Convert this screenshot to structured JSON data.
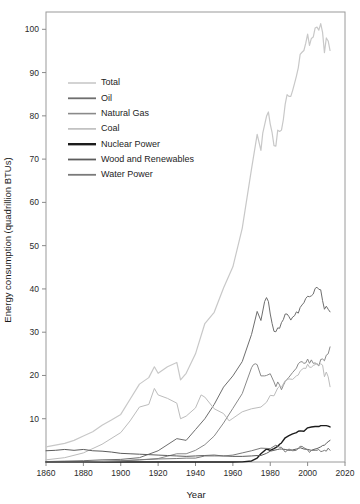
{
  "chart_data": {
    "type": "line",
    "title": "",
    "subtitle": "",
    "xlabel": "Year",
    "ylabel": "Energy consumption (quadrillion BTUs)",
    "xlim": [
      1860,
      2020
    ],
    "ylim": [
      0,
      104
    ],
    "grid": false,
    "legend_position": "upper-left-inside",
    "xticks": [
      1860,
      1880,
      1900,
      1920,
      1940,
      1960,
      1980,
      2000,
      2020
    ],
    "xtick_labels": [
      "1860",
      "1880",
      "1900",
      "1920",
      "1940",
      "1960",
      "1980",
      "2000",
      "2020"
    ],
    "yticks": [
      10,
      20,
      30,
      40,
      50,
      60,
      70,
      80,
      90,
      100
    ],
    "ytick_labels": [
      "10",
      "20",
      "30",
      "40",
      "50",
      "60",
      "70",
      "80",
      "90",
      "100"
    ],
    "series": [
      {
        "name": "Total",
        "color": "#c8c8c8",
        "width": 1.2,
        "x": [
          1860,
          1865,
          1870,
          1875,
          1880,
          1885,
          1890,
          1895,
          1900,
          1905,
          1910,
          1915,
          1918,
          1920,
          1925,
          1930,
          1932,
          1935,
          1940,
          1945,
          1950,
          1955,
          1960,
          1965,
          1970,
          1973,
          1975,
          1976,
          1978,
          1979,
          1980,
          1981,
          1982,
          1983,
          1984,
          1985,
          1986,
          1987,
          1988,
          1989,
          1990,
          1991,
          1992,
          1993,
          1994,
          1995,
          1996,
          1997,
          1998,
          1999,
          2000,
          2001,
          2002,
          2003,
          2004,
          2005,
          2006,
          2007,
          2008,
          2009,
          2010,
          2011,
          2012
        ],
        "y": [
          3.5,
          3.9,
          4.3,
          5.0,
          6.0,
          7.0,
          8.5,
          9.7,
          11.0,
          14.5,
          18.0,
          19.5,
          22.0,
          20.5,
          22.0,
          23.0,
          19.0,
          20.5,
          25.0,
          32.0,
          34.6,
          40.2,
          45.1,
          54.0,
          67.8,
          75.7,
          72.0,
          76.0,
          79.9,
          80.9,
          78.1,
          76.1,
          73.1,
          73.0,
          76.7,
          76.4,
          76.7,
          79.1,
          82.7,
          84.9,
          84.5,
          84.5,
          85.9,
          87.5,
          89.2,
          91.1,
          94.2,
          94.7,
          95.1,
          96.8,
          98.9,
          96.3,
          97.9,
          98.2,
          100.3,
          100.5,
          99.8,
          101.3,
          99.3,
          94.6,
          98.0,
          97.3,
          95.1
        ]
      },
      {
        "name": "Oil",
        "color": "#6e6e6e",
        "width": 1.0,
        "x": [
          1860,
          1870,
          1880,
          1890,
          1900,
          1910,
          1920,
          1930,
          1935,
          1940,
          1945,
          1950,
          1955,
          1960,
          1965,
          1970,
          1973,
          1975,
          1977,
          1978,
          1979,
          1980,
          1981,
          1982,
          1983,
          1984,
          1985,
          1986,
          1987,
          1988,
          1989,
          1990,
          1991,
          1992,
          1993,
          1994,
          1995,
          1996,
          1997,
          1998,
          1999,
          2000,
          2001,
          2002,
          2003,
          2004,
          2005,
          2006,
          2007,
          2008,
          2009,
          2010,
          2011,
          2012
        ],
        "y": [
          0.1,
          0.2,
          0.3,
          0.5,
          0.6,
          1.0,
          2.6,
          5.4,
          5.0,
          7.5,
          10.0,
          13.3,
          17.3,
          19.9,
          23.2,
          29.5,
          34.8,
          32.7,
          37.1,
          38.0,
          37.1,
          34.2,
          32.0,
          30.2,
          30.1,
          31.0,
          30.9,
          32.2,
          32.9,
          34.2,
          34.2,
          33.6,
          32.8,
          33.5,
          33.8,
          34.7,
          34.4,
          35.7,
          36.3,
          36.8,
          37.8,
          38.3,
          38.2,
          38.4,
          38.8,
          40.1,
          40.4,
          39.9,
          39.8,
          37.3,
          35.3,
          36.0,
          35.3,
          34.7
        ]
      },
      {
        "name": "Natural Gas",
        "color": "#8a8a8a",
        "width": 1.0,
        "x": [
          1860,
          1880,
          1890,
          1900,
          1910,
          1920,
          1930,
          1935,
          1940,
          1945,
          1950,
          1955,
          1960,
          1965,
          1970,
          1971,
          1972,
          1973,
          1975,
          1977,
          1978,
          1980,
          1982,
          1983,
          1984,
          1985,
          1986,
          1987,
          1988,
          1990,
          1992,
          1994,
          1995,
          1996,
          1997,
          1998,
          1999,
          2000,
          2001,
          2002,
          2003,
          2004,
          2005,
          2006,
          2007,
          2008,
          2009,
          2010,
          2011,
          2012
        ],
        "y": [
          0.0,
          0.1,
          0.2,
          0.3,
          0.5,
          0.8,
          1.9,
          1.9,
          2.7,
          4.0,
          6.0,
          9.0,
          12.4,
          15.8,
          21.8,
          22.5,
          22.7,
          22.5,
          19.9,
          19.9,
          20.0,
          20.4,
          18.5,
          17.4,
          18.5,
          17.8,
          16.7,
          17.7,
          18.6,
          19.6,
          20.7,
          21.7,
          22.7,
          23.1,
          23.2,
          22.8,
          22.9,
          23.8,
          22.8,
          23.6,
          22.8,
          22.9,
          22.6,
          22.2,
          23.7,
          23.8,
          23.4,
          24.7,
          25.0,
          26.6
        ]
      },
      {
        "name": "Coal",
        "color": "#bcbcbc",
        "width": 1.0,
        "x": [
          1860,
          1870,
          1880,
          1890,
          1900,
          1905,
          1910,
          1915,
          1918,
          1920,
          1925,
          1930,
          1932,
          1935,
          1940,
          1943,
          1945,
          1950,
          1955,
          1958,
          1960,
          1965,
          1970,
          1975,
          1978,
          1980,
          1982,
          1984,
          1985,
          1986,
          1988,
          1990,
          1992,
          1994,
          1995,
          1996,
          1997,
          1998,
          1999,
          2000,
          2001,
          2002,
          2003,
          2004,
          2005,
          2006,
          2007,
          2008,
          2009,
          2010,
          2011,
          2012
        ],
        "y": [
          0.5,
          1.0,
          2.1,
          4.1,
          6.8,
          9.5,
          12.7,
          13.3,
          17.0,
          15.5,
          14.7,
          13.6,
          10.0,
          10.6,
          12.5,
          15.5,
          15.0,
          12.3,
          11.2,
          9.5,
          10.1,
          11.6,
          12.3,
          12.7,
          13.8,
          15.4,
          15.3,
          17.1,
          17.5,
          17.3,
          18.8,
          19.2,
          19.1,
          19.9,
          20.1,
          21.0,
          21.4,
          21.7,
          21.6,
          22.6,
          21.9,
          21.9,
          22.3,
          22.5,
          22.8,
          22.4,
          22.7,
          22.4,
          19.7,
          20.8,
          19.7,
          17.4
        ]
      },
      {
        "name": "Nuclear Power",
        "color": "#1c1c1c",
        "width": 1.4,
        "x": [
          1860,
          1950,
          1957,
          1960,
          1965,
          1970,
          1973,
          1975,
          1978,
          1980,
          1982,
          1984,
          1985,
          1986,
          1988,
          1990,
          1992,
          1994,
          1995,
          1996,
          1998,
          2000,
          2002,
          2004,
          2005,
          2006,
          2007,
          2008,
          2009,
          2010,
          2011,
          2012
        ],
        "y": [
          0.0,
          0.0,
          0.0,
          0.0,
          0.04,
          0.24,
          0.91,
          1.9,
          3.0,
          2.7,
          3.1,
          3.6,
          4.1,
          4.4,
          5.6,
          6.1,
          6.5,
          6.8,
          7.1,
          7.2,
          7.1,
          7.9,
          8.1,
          8.2,
          8.2,
          8.2,
          8.4,
          8.4,
          8.4,
          8.4,
          8.3,
          8.1
        ]
      },
      {
        "name": "Wood and Renewables",
        "color": "#5c5c5c",
        "width": 1.0,
        "x": [
          1860,
          1865,
          1870,
          1875,
          1880,
          1885,
          1890,
          1895,
          1900,
          1905,
          1910,
          1915,
          1920,
          1925,
          1930,
          1935,
          1940,
          1945,
          1950,
          1955,
          1960,
          1965,
          1970,
          1973,
          1975,
          1978,
          1980,
          1982,
          1984,
          1985,
          1986,
          1988,
          1990,
          1992,
          1994,
          1995,
          1996,
          1998,
          2000,
          2002,
          2004,
          2005,
          2006,
          2007,
          2008,
          2009,
          2010,
          2011,
          2012
        ],
        "y": [
          2.6,
          2.7,
          2.9,
          2.7,
          2.9,
          2.6,
          2.5,
          2.3,
          2.0,
          1.9,
          1.8,
          1.7,
          1.6,
          1.5,
          1.4,
          1.3,
          1.4,
          1.5,
          1.6,
          1.4,
          1.3,
          1.3,
          1.4,
          1.5,
          1.5,
          2.0,
          2.5,
          2.7,
          2.9,
          3.0,
          3.0,
          2.9,
          2.7,
          2.8,
          3.0,
          3.1,
          3.3,
          3.0,
          2.9,
          2.7,
          3.0,
          3.1,
          3.3,
          3.5,
          3.8,
          3.9,
          4.3,
          4.7,
          5.0
        ]
      },
      {
        "name": "Water Power",
        "color": "#7a7a7a",
        "width": 1.0,
        "x": [
          1860,
          1880,
          1890,
          1900,
          1910,
          1920,
          1930,
          1935,
          1940,
          1945,
          1950,
          1955,
          1960,
          1965,
          1970,
          1975,
          1980,
          1983,
          1985,
          1986,
          1988,
          1990,
          1992,
          1994,
          1995,
          1996,
          1997,
          1998,
          2000,
          2001,
          2002,
          2004,
          2005,
          2006,
          2007,
          2008,
          2009,
          2010,
          2011,
          2012
        ],
        "y": [
          0.0,
          0.0,
          0.1,
          0.25,
          0.5,
          0.7,
          0.8,
          0.9,
          0.9,
          1.4,
          1.4,
          1.4,
          1.6,
          2.1,
          2.6,
          3.2,
          3.1,
          3.9,
          3.4,
          3.4,
          2.3,
          3.0,
          2.6,
          2.7,
          3.2,
          3.6,
          3.6,
          3.3,
          2.8,
          2.2,
          2.7,
          2.7,
          2.7,
          2.9,
          2.4,
          2.5,
          2.7,
          2.5,
          3.2,
          2.7
        ]
      }
    ],
    "legend": [
      {
        "label": "Total",
        "color": "#c8c8c8",
        "width": 1.6
      },
      {
        "label": "Oil",
        "color": "#6e6e6e",
        "width": 1.8
      },
      {
        "label": "Natural Gas",
        "color": "#8a8a8a",
        "width": 1.6
      },
      {
        "label": "Coal",
        "color": "#bcbcbc",
        "width": 1.6
      },
      {
        "label": "Nuclear Power",
        "color": "#1c1c1c",
        "width": 2.4
      },
      {
        "label": "Wood and Renewables",
        "color": "#5c5c5c",
        "width": 1.8
      },
      {
        "label": "Water Power",
        "color": "#7a7a7a",
        "width": 1.8
      }
    ]
  }
}
